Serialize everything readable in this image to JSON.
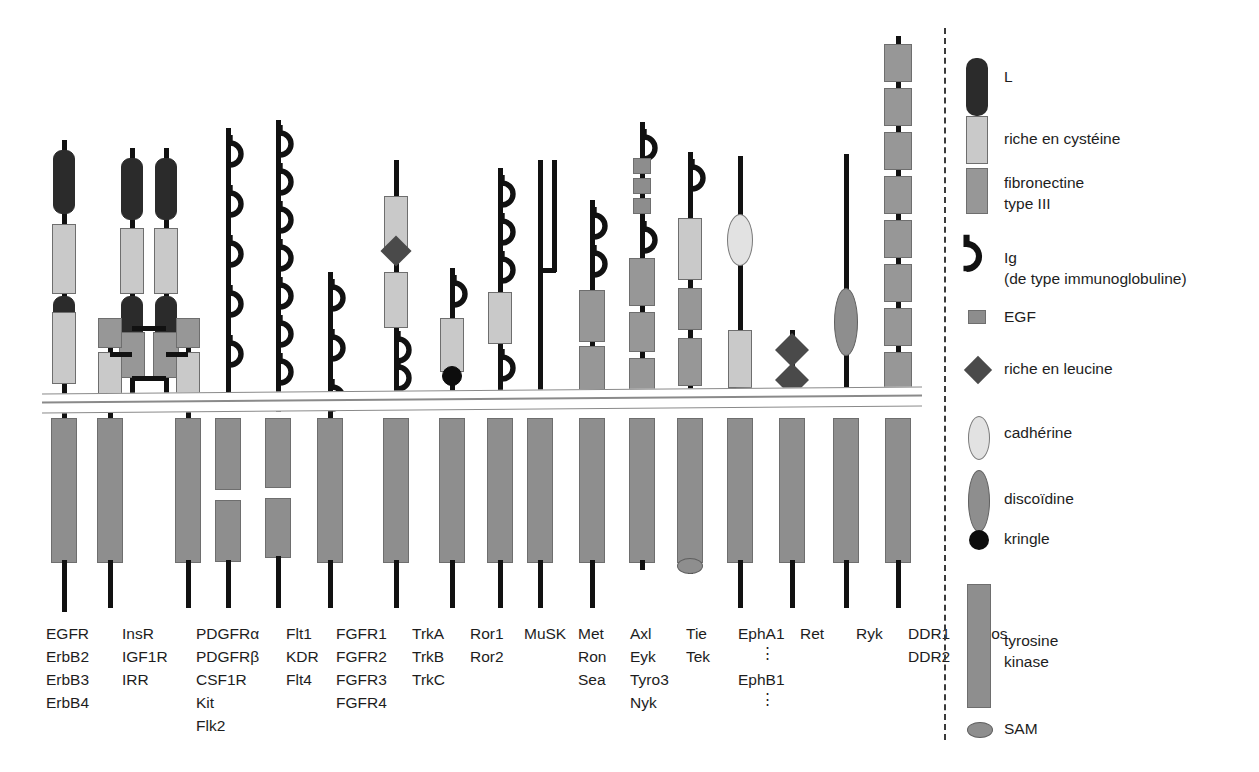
{
  "figure": {
    "kind": "receptor-tyrosine-kinase-families-diagram",
    "language": "fr"
  },
  "membrane": {
    "name": "membrane-plasmique"
  },
  "legend": {
    "items": [
      {
        "icon": "L-domain-icon",
        "label": "L"
      },
      {
        "icon": "cysteine-rich-icon",
        "label": "riche en cystéine"
      },
      {
        "icon": "fibronectin-iii-icon",
        "label": "fibronectine",
        "label2": "type III"
      },
      {
        "icon": "ig-domain-icon",
        "label": "Ig",
        "label2": "(de type immunoglobuline)"
      },
      {
        "icon": "egf-domain-icon",
        "label": "EGF"
      },
      {
        "icon": "leucine-rich-icon",
        "label": "riche en leucine"
      },
      {
        "icon": "cadherin-icon",
        "label": "cadhérine"
      },
      {
        "icon": "discoidin-icon",
        "label": "discoïdine"
      },
      {
        "icon": "kringle-icon",
        "label": "kringle"
      },
      {
        "icon": "tyrosine-kinase-icon",
        "label": "tyrosine",
        "label2": "kinase"
      },
      {
        "icon": "sam-domain-icon",
        "label": "SAM"
      }
    ]
  },
  "colors": {
    "L": "#2b2b2b",
    "cysteine_rich": "#c9c9c9",
    "fibronectin_iii": "#979797",
    "egf": "#8d8d8d",
    "tyrosine_kinase": "#8e8e8e",
    "cadherin": "#e2e2e2",
    "discoidin": "#8e8e8e",
    "kringle": "#0d0d0d",
    "leucine_rich": "#4a4a4a",
    "sam": "#8e8e8e",
    "chain": "#111111",
    "membrane_line": "#8a8a8a"
  },
  "families": [
    {
      "id": "egfr",
      "members": [
        "EGFR",
        "ErbB2",
        "ErbB3",
        "ErbB4"
      ]
    },
    {
      "id": "insr",
      "members": [
        "InsR",
        "IGF1R",
        "IRR"
      ]
    },
    {
      "id": "pdgfr",
      "members": [
        "PDGFRα",
        "PDGFRβ",
        "CSF1R",
        "Kit",
        "Flk2"
      ]
    },
    {
      "id": "flt1",
      "members": [
        "Flt1",
        "KDR",
        "Flt4"
      ]
    },
    {
      "id": "fgfr",
      "members": [
        "FGFR1",
        "FGFR2",
        "FGFR3",
        "FGFR4"
      ]
    },
    {
      "id": "trk",
      "members": [
        "TrkA",
        "TrkB",
        "TrkC"
      ]
    },
    {
      "id": "ror",
      "members": [
        "Ror1",
        "Ror2"
      ]
    },
    {
      "id": "musk",
      "members": [
        "MuSK"
      ]
    },
    {
      "id": "met",
      "members": [
        "Met",
        "Ron",
        "Sea"
      ]
    },
    {
      "id": "axl",
      "members": [
        "Axl",
        "Eyk",
        "Tyro3",
        "Nyk"
      ]
    },
    {
      "id": "tie",
      "members": [
        "Tie",
        "Tek"
      ]
    },
    {
      "id": "eph",
      "members": [
        "EphA1",
        "EphB1"
      ],
      "continuation": "⋮"
    },
    {
      "id": "ret",
      "members": [
        "Ret"
      ]
    },
    {
      "id": "ryk",
      "members": [
        "Ryk"
      ]
    },
    {
      "id": "ddr",
      "members": [
        "DDR1",
        "DDR2"
      ]
    },
    {
      "id": "ros",
      "members": [
        "Ros"
      ]
    }
  ]
}
